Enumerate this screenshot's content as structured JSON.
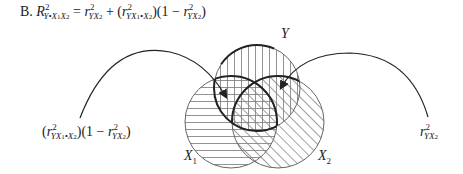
{
  "equation": {
    "prefix": "B.",
    "lhs_symbol": "R",
    "lhs_sup": "2",
    "lhs_sub": "Y•X",
    "lhs_sub_i1": "1",
    "lhs_sub_x2": "X",
    "lhs_sub_i2": "2",
    "equals": "=",
    "t1_symbol": "r",
    "t1_sup": "2",
    "t1_sub": "YX",
    "t1_sub_i": "2",
    "plus": "+",
    "t2_open": "(",
    "t2_symbol": "r",
    "t2_sup": "2",
    "t2_sub": "YX",
    "t2_sub_i1": "1",
    "t2_sub_dot": "•X",
    "t2_sub_i2": "2",
    "t2_close": ")(1 − ",
    "t3_symbol": "r",
    "t3_sup": "2",
    "t3_sub": "YX",
    "t3_sub_i": "2",
    "t3_close": ")"
  },
  "labels": {
    "circle_y": "Y",
    "circle_x1": "X",
    "circle_x1_i": "1",
    "circle_x2": "X",
    "circle_x2_i": "2",
    "left_open": "(",
    "left_symbol": "r",
    "left_sup": "2",
    "left_sub": "YX",
    "left_sub_i1": "1",
    "left_sub_dot": "•X",
    "left_sub_i2": "2",
    "left_close": ")(1 − ",
    "left_t_symbol": "r",
    "left_t_sup": "2",
    "left_t_sub": "YX",
    "left_t_sub_i": "2",
    "left_t_close": ")",
    "right_symbol": "r",
    "right_sup": "2",
    "right_sub": "YX",
    "right_sub_i": "2"
  }
}
